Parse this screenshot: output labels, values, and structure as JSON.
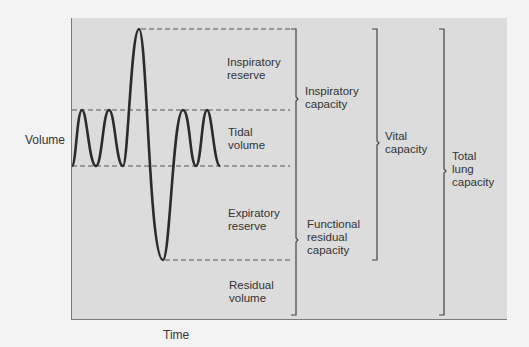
{
  "diagram": {
    "axes": {
      "y_label": "Volume",
      "x_label": "Time"
    },
    "volumes": [
      {
        "id": "inspiratory-reserve",
        "line1": "Inspiratory",
        "line2": "reserve"
      },
      {
        "id": "tidal-volume",
        "line1": "Tidal",
        "line2": "volume"
      },
      {
        "id": "expiratory-reserve",
        "line1": "Expiratory",
        "line2": "reserve"
      },
      {
        "id": "residual-volume",
        "line1": "Residual",
        "line2": "volume"
      }
    ],
    "capacities": [
      {
        "id": "inspiratory-capacity",
        "line1": "Inspiratory",
        "line2": "capacity",
        "line3": ""
      },
      {
        "id": "functional-residual-capacity",
        "line1": "Functional",
        "line2": "residual",
        "line3": "capacity"
      },
      {
        "id": "vital-capacity",
        "line1": "Vital",
        "line2": "capacity",
        "line3": ""
      },
      {
        "id": "total-lung-capacity",
        "line1": "Total",
        "line2": "lung",
        "line3": "capacity"
      }
    ],
    "colors": {
      "background": "#f3f3f3",
      "panel": "#dcdcdc",
      "curve": "#2b2b2b",
      "dashed_lines": "#555555",
      "brackets": "#444444"
    }
  }
}
